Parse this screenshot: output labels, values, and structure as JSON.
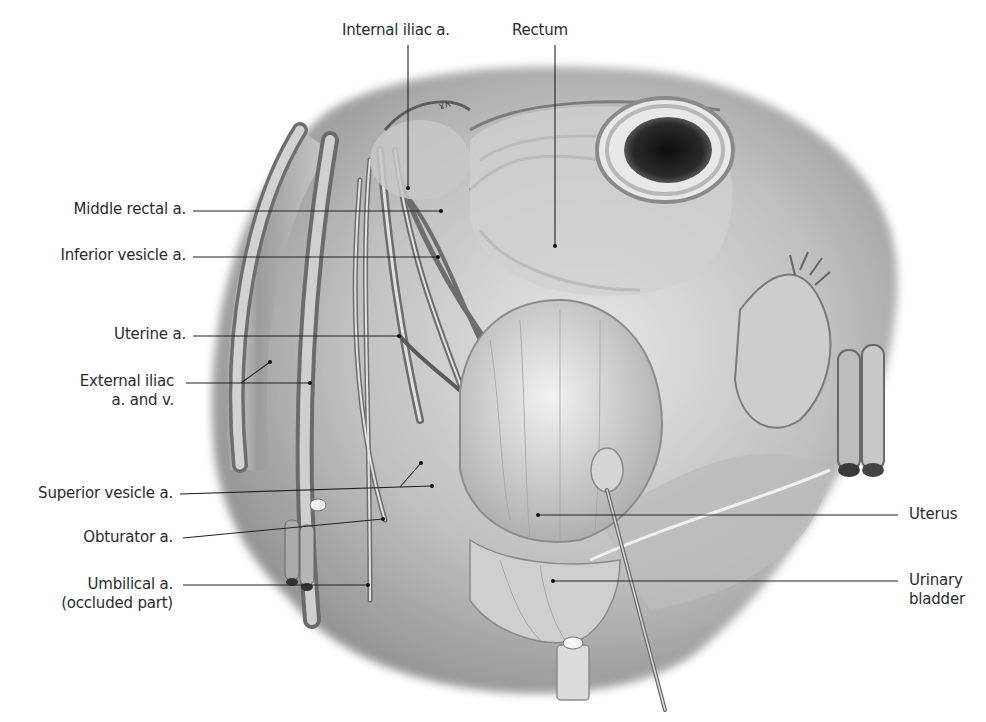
{
  "figure": {
    "title_fragment": "Internal iliac artery branches in the female pelvis (partially cut off at top)",
    "colors": {
      "background": "#ffffff",
      "label_text": "#2b2b2b",
      "leader_line": "#222222",
      "illustration_tone": "#8a8a8a"
    }
  },
  "labels": {
    "internal_iliac": {
      "text": "Internal iliac a."
    },
    "rectum": {
      "text": "Rectum"
    },
    "middle_rectal": {
      "text": "Middle rectal a."
    },
    "inferior_vesicle": {
      "text": "Inferior vesicle a."
    },
    "uterine": {
      "text": "Uterine a."
    },
    "external_iliac": {
      "line1": "External iliac",
      "line2": "a. and v."
    },
    "superior_vesicle": {
      "text": "Superior vesicle a."
    },
    "obturator": {
      "text": "Obturator a."
    },
    "umbilical": {
      "line1": "Umbilical a.",
      "line2": "(occluded part)"
    },
    "uterus": {
      "text": "Uterus"
    },
    "urinary_bladder": {
      "line1": "Urinary",
      "line2": "bladder"
    }
  }
}
